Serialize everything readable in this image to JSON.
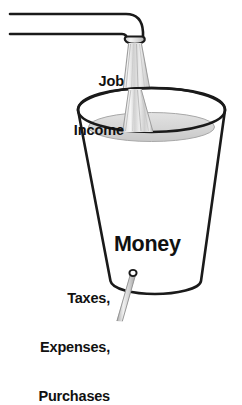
{
  "diagram": {
    "type": "conceptual-illustration",
    "background_color": "#ffffff",
    "line_color": "#1a1a1a",
    "labels": {
      "inflow": {
        "name": "job-income",
        "line1": "Job",
        "line2": "Income",
        "align": "right"
      },
      "container": {
        "name": "money",
        "text": "Money"
      },
      "outflow": {
        "name": "taxes-expenses-purchases",
        "line1": "Taxes,",
        "line2": "Expenses,",
        "line3": "Purchases",
        "align": "right"
      }
    },
    "parts": {
      "pipe": "horizontal-pipe-with-elbow",
      "spout": "flared-nozzle",
      "inflow_stream": "pouring-stream",
      "bucket": "tapered-bucket",
      "liquid": "liquid-surface-ellipse",
      "leak_hole": "leak-hole",
      "outflow_stream": "leaking-stream"
    },
    "colors": {
      "outline": "#1a1a1a",
      "liquid_fill": "#d6d6d6",
      "liquid_edge": "#bdbdbd",
      "stream_fill": "#d9d9d9",
      "stream_highlight": "#f2f2f2",
      "stream_shadow": "#b5b5b5",
      "bucket_fill": "#ffffff",
      "text": "#111111"
    }
  }
}
